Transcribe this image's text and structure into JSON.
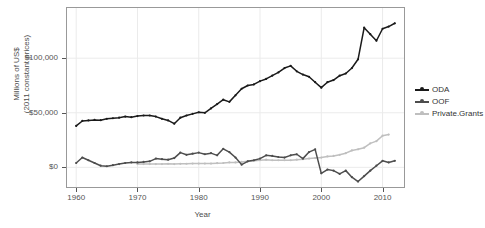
{
  "chart_data": {
    "type": "line",
    "title": "",
    "xlabel": "Year",
    "ylabel_lines": [
      "Millions of US$",
      "(2011 constant prices)"
    ],
    "xlim": [
      1958.5,
      2013.5
    ],
    "ylim": [
      -18000,
      146000
    ],
    "xticks": [
      1960,
      1970,
      1980,
      1990,
      2000,
      2010
    ],
    "xticklabels": [
      "1960",
      "1970",
      "1980",
      "1990",
      "2000",
      "2010"
    ],
    "yticks": [
      0,
      50000,
      100000
    ],
    "yticklabels": [
      "$0",
      "$50,000",
      "$100,000"
    ],
    "grid": true,
    "legend_position": "right",
    "colors": {
      "ODA": "#1a1a1a",
      "OOF": "#4d4d4d",
      "Private.Grants": "#bfbfbf",
      "panel_border": "#999999",
      "gridline": "#ebebeb",
      "text": "#4d4d4d"
    },
    "series": [
      {
        "name": "ODA",
        "color": "#1a1a1a",
        "x": [
          1960,
          1961,
          1962,
          1963,
          1964,
          1965,
          1966,
          1967,
          1968,
          1969,
          1970,
          1971,
          1972,
          1973,
          1974,
          1975,
          1976,
          1977,
          1978,
          1979,
          1980,
          1981,
          1982,
          1983,
          1984,
          1985,
          1986,
          1987,
          1988,
          1989,
          1990,
          1991,
          1992,
          1993,
          1994,
          1995,
          1996,
          1997,
          1998,
          1999,
          2000,
          2001,
          2002,
          2003,
          2004,
          2005,
          2006,
          2007,
          2008,
          2009,
          2010,
          2011,
          2012
        ],
        "values": [
          38000,
          42500,
          43000,
          43500,
          43200,
          44500,
          45000,
          45500,
          46500,
          46000,
          47000,
          47500,
          47500,
          46500,
          44500,
          43000,
          40000,
          45500,
          47500,
          49000,
          50500,
          50000,
          54000,
          58000,
          62000,
          60000,
          66000,
          72000,
          75000,
          76000,
          79000,
          81000,
          84000,
          87000,
          91000,
          93000,
          88000,
          85000,
          83000,
          78000,
          73000,
          78000,
          80000,
          84000,
          86000,
          91000,
          99000,
          128000,
          122000,
          116000,
          127000,
          129000,
          132000
        ],
        "last_value_note": "2012 value around $124,000"
      },
      {
        "name": "OOF",
        "color": "#4d4d4d",
        "x": [
          1960,
          1961,
          1962,
          1963,
          1964,
          1965,
          1966,
          1967,
          1968,
          1969,
          1970,
          1971,
          1972,
          1973,
          1974,
          1975,
          1976,
          1977,
          1978,
          1979,
          1980,
          1981,
          1982,
          1983,
          1984,
          1985,
          1986,
          1987,
          1988,
          1989,
          1990,
          1991,
          1992,
          1993,
          1994,
          1995,
          1996,
          1997,
          1998,
          1999,
          2000,
          2001,
          2002,
          2003,
          2004,
          2005,
          2006,
          2007,
          2008,
          2009,
          2010,
          2011,
          2012
        ],
        "values": [
          4000,
          9000,
          6500,
          4000,
          1500,
          1000,
          2000,
          3000,
          4000,
          4500,
          4500,
          5000,
          5500,
          8000,
          7500,
          7000,
          8500,
          13500,
          11500,
          12500,
          13500,
          12000,
          13000,
          11000,
          17000,
          14000,
          9000,
          2500,
          5500,
          6500,
          8000,
          11000,
          10500,
          9500,
          9000,
          11000,
          12000,
          8000,
          14000,
          16500,
          -5500,
          -2000,
          -3000,
          -6000,
          -3000,
          -9000,
          -13000,
          -8000,
          -3000,
          1500,
          6000,
          4500,
          6000
        ]
      },
      {
        "name": "Private.Grants",
        "color": "#bfbfbf",
        "x": [
          1970,
          1971,
          1972,
          1973,
          1974,
          1975,
          1976,
          1977,
          1978,
          1979,
          1980,
          1981,
          1982,
          1983,
          1984,
          1985,
          1986,
          1987,
          1988,
          1989,
          1990,
          1991,
          1992,
          1993,
          1994,
          1995,
          1996,
          1997,
          1998,
          1999,
          2000,
          2001,
          2002,
          2003,
          2004,
          2005,
          2006,
          2007,
          2008,
          2009,
          2010,
          2011
        ],
        "values": [
          3000,
          3000,
          3000,
          3000,
          3000,
          3200,
          3000,
          3200,
          3300,
          3500,
          3500,
          3500,
          3500,
          3800,
          4000,
          4500,
          4500,
          5000,
          5500,
          6000,
          6500,
          7000,
          6500,
          6500,
          6500,
          6500,
          7000,
          7500,
          8000,
          8500,
          9000,
          10000,
          10500,
          11500,
          13000,
          15500,
          16500,
          18000,
          22000,
          24000,
          29000,
          30000
        ]
      }
    ]
  },
  "legend": {
    "title": "",
    "items": [
      {
        "label": "ODA",
        "color": "#1a1a1a"
      },
      {
        "label": "OOF",
        "color": "#4d4d4d"
      },
      {
        "label": "Private.Grants",
        "color": "#bfbfbf"
      }
    ]
  }
}
